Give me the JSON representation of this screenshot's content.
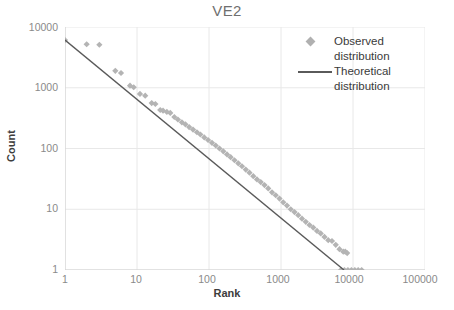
{
  "chart_data": {
    "type": "scatter",
    "title": "VE2",
    "xlabel": "Rank",
    "ylabel": "Count",
    "xscale": "log",
    "yscale": "log",
    "xlim": [
      1,
      100000
    ],
    "ylim": [
      1,
      10000
    ],
    "xticks": [
      "1",
      "10",
      "100",
      "1000",
      "10000",
      "100000"
    ],
    "yticks": [
      "1",
      "10",
      "100",
      "1000",
      "10000"
    ],
    "grid": true,
    "legend_position": "top-right",
    "series": [
      {
        "name": "Observed distribution",
        "marker": "diamond",
        "color": "#b0b0b0",
        "points": [
          [
            1,
            6100
          ],
          [
            2,
            5200
          ],
          [
            3,
            5100
          ],
          [
            5,
            1900
          ],
          [
            6,
            1750
          ],
          [
            8,
            1080
          ],
          [
            9,
            1020
          ],
          [
            11,
            790
          ],
          [
            13,
            740
          ],
          [
            16,
            560
          ],
          [
            18,
            540
          ],
          [
            21,
            430
          ],
          [
            23,
            420
          ],
          [
            26,
            400
          ],
          [
            29,
            385
          ],
          [
            33,
            330
          ],
          [
            37,
            300
          ],
          [
            42,
            270
          ],
          [
            47,
            250
          ],
          [
            53,
            225
          ],
          [
            60,
            205
          ],
          [
            68,
            185
          ],
          [
            76,
            170
          ],
          [
            86,
            152
          ],
          [
            97,
            138
          ],
          [
            110,
            124
          ],
          [
            124,
            112
          ],
          [
            140,
            100
          ],
          [
            158,
            90
          ],
          [
            178,
            80
          ],
          [
            200,
            72
          ],
          [
            226,
            64
          ],
          [
            255,
            57
          ],
          [
            287,
            51
          ],
          [
            324,
            45
          ],
          [
            365,
            40
          ],
          [
            412,
            35
          ],
          [
            464,
            31
          ],
          [
            523,
            28
          ],
          [
            590,
            25
          ],
          [
            665,
            22
          ],
          [
            750,
            19
          ],
          [
            845,
            17
          ],
          [
            953,
            15
          ],
          [
            1074,
            13
          ],
          [
            1211,
            11.5
          ],
          [
            1366,
            10
          ],
          [
            1540,
            9
          ],
          [
            1736,
            8
          ],
          [
            1957,
            7
          ],
          [
            2207,
            6.2
          ],
          [
            2488,
            5.5
          ],
          [
            2805,
            5
          ],
          [
            3162,
            4.4
          ],
          [
            3565,
            4
          ],
          [
            4019,
            3.5
          ],
          [
            4531,
            3.1
          ],
          [
            5109,
            3
          ],
          [
            5760,
            2.6
          ],
          [
            6494,
            2.2
          ],
          [
            7322,
            2
          ],
          [
            7800,
            2
          ],
          [
            8300,
            1.9
          ],
          [
            6800,
            1
          ],
          [
            7600,
            1
          ],
          [
            8500,
            1
          ],
          [
            9500,
            1
          ],
          [
            10600,
            1
          ],
          [
            11800,
            1
          ],
          [
            13200,
            1
          ]
        ]
      },
      {
        "name": "Theoretical distribution",
        "marker": "line",
        "color": "#5a5a5a",
        "points": [
          [
            1,
            6100
          ],
          [
            7500,
            1
          ]
        ]
      }
    ]
  },
  "legend": {
    "items": [
      {
        "label_line1": "Observed",
        "label_line2": "distribution",
        "key": "diamond-marker"
      },
      {
        "label_line1": "Theoretical",
        "label_line2": "distribution",
        "key": "line-marker"
      }
    ]
  }
}
